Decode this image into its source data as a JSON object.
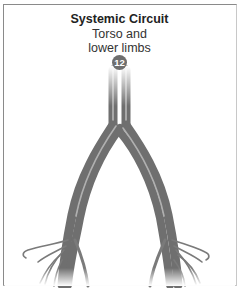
{
  "diagram": {
    "title": "Systemic Circuit",
    "subtitle_line1": "Torso and",
    "subtitle_line2": "lower limbs",
    "step_badge": "12",
    "colors": {
      "vessel": "#7a7a7a",
      "vessel_dark": "#555555",
      "vessel_light": "#b5b5b5",
      "badge": "#6e6e6e",
      "border": "#8a8a8a"
    }
  }
}
